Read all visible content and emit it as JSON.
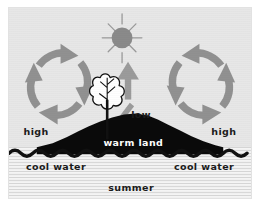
{
  "figure": {
    "background_color": "#e7e7e7",
    "water_color": "#efefef",
    "land_color": "#0a0a0a",
    "arrow_color": "#8f8f8f",
    "sun_color": "#8a8a8a",
    "text_color": "#1b1b1b",
    "tree_color": "#ffffff"
  },
  "labels": {
    "pressure_high_left": "high",
    "pressure_low_center": "low",
    "pressure_high_right": "high",
    "land": "warm land",
    "water_left": "cool water",
    "water_right": "cool water",
    "season": "summer"
  },
  "elements": {
    "sun": "sun-icon",
    "tree": "tree-icon",
    "updraft": "upward-arrow-icon",
    "circulation_left": "clockwise-circulation-arrows",
    "circulation_right": "counterclockwise-circulation-arrows",
    "shoreline": "wavy-water-line",
    "sun_ray_count": 8
  }
}
